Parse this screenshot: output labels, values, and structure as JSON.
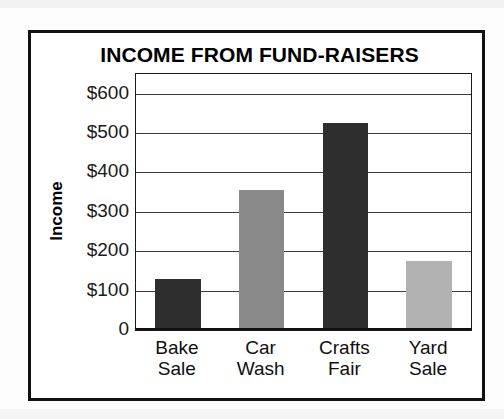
{
  "chart_data": {
    "type": "bar",
    "title": "INCOME FROM FUND-RAISERS",
    "xlabel": "",
    "ylabel": "Income",
    "categories": [
      "Bake Sale",
      "Car Wash",
      "Crafts Fair",
      "Yard Sale"
    ],
    "category_lines": [
      [
        "Bake",
        "Sale"
      ],
      [
        "Car",
        "Wash"
      ],
      [
        "Crafts",
        "Fair"
      ],
      [
        "Yard",
        "Sale"
      ]
    ],
    "values": [
      130,
      355,
      525,
      175
    ],
    "value_prefix": "$",
    "ylim": [
      0,
      650
    ],
    "ytick_values": [
      0,
      100,
      200,
      300,
      400,
      500,
      600
    ],
    "ytick_labels": [
      "0",
      "$100",
      "$200",
      "$300",
      "$400",
      "$500",
      "$600"
    ],
    "grid": "horizontal",
    "legend": "none",
    "bar_colors": [
      "#2e2e2e",
      "#8a8a8a",
      "#2e2e2e",
      "#b2b2b2"
    ],
    "axis_color": "#1a1a1a",
    "frame_color": "#111111",
    "background": "#ffffff"
  }
}
